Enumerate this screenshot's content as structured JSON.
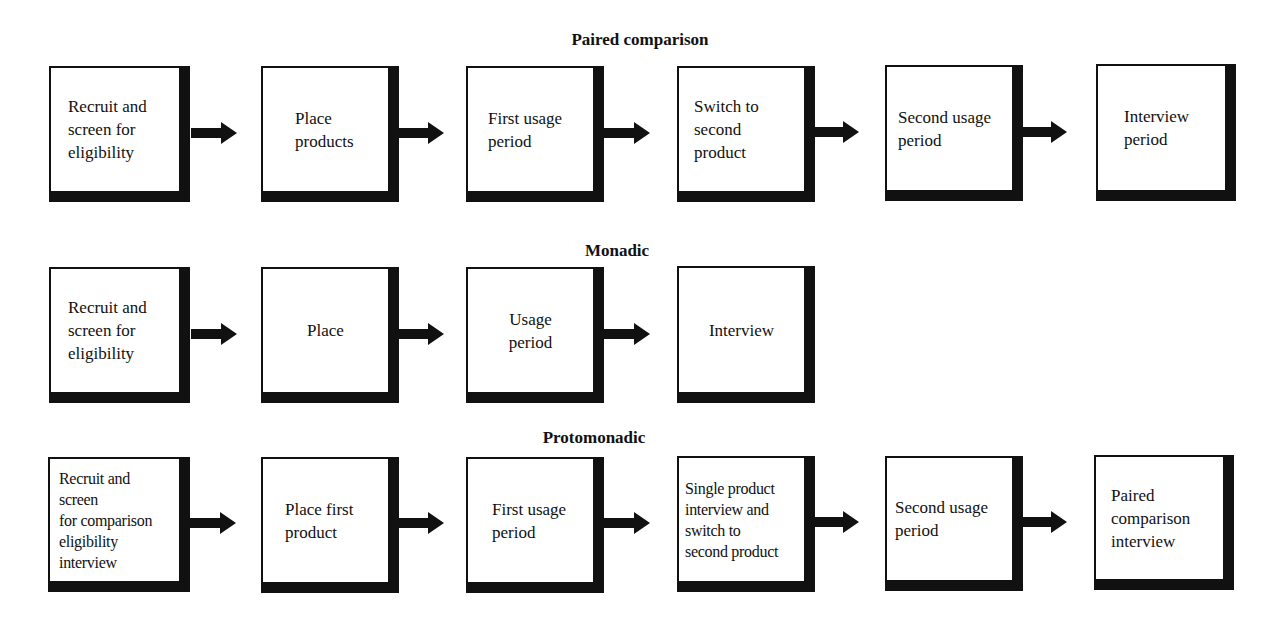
{
  "diagram": {
    "sections": [
      {
        "title": "Paired comparison",
        "steps": [
          "Recruit and\nscreen for\neligibility",
          "Place\nproducts",
          "First usage\nperiod",
          "Switch to\nsecond\nproduct",
          "Second usage\nperiod",
          "Interview\nperiod"
        ]
      },
      {
        "title": "Monadic",
        "steps": [
          "Recruit and\nscreen for\neligibility",
          "Place",
          "Usage\nperiod",
          "Interview"
        ]
      },
      {
        "title": "Protomonadic",
        "steps": [
          "Recruit and\nscreen\nfor comparison\neligibility\ninterview",
          "Place first\nproduct",
          "First usage\nperiod",
          "Single product\ninterview and\nswitch to\nsecond product",
          "Second usage\nperiod",
          "Paired\ncomparison\ninterview"
        ]
      }
    ],
    "arrow_icon": "right-block-arrow",
    "colors": {
      "ink": "#111111",
      "background": "#ffffff"
    }
  }
}
